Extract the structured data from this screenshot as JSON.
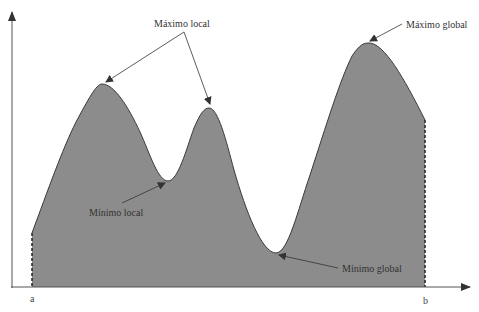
{
  "diagram": {
    "fill_color": "#8c8c8c",
    "stroke_color": "#3a3a3a",
    "axis_color": "#555555",
    "x_axis": {
      "start_label": "a",
      "end_label": "b"
    },
    "annotations": {
      "max_local": "Máximo local",
      "min_local": "Mínimo local",
      "max_global": "Máximo global",
      "min_global": "Mínimo global"
    }
  }
}
